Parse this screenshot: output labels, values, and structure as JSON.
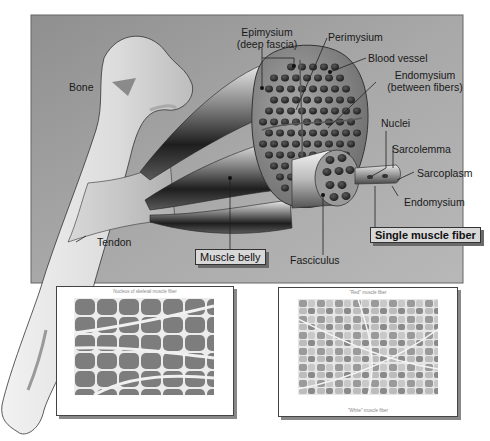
{
  "figure": {
    "colors": {
      "panel_bg": "#9e9e9e",
      "bone": "#e4e4e4",
      "muscle_dark": "#2e2e2e",
      "fascicle": "#8a8a8a",
      "label_box": "#d8d8d8"
    }
  },
  "labels": {
    "bone": "Bone",
    "tendon": "Tendon",
    "epimysium_line1": "Epimysium",
    "epimysium_line2": "(deep fascia)",
    "perimysium": "Perimysium",
    "blood_vessel": "Blood vessel",
    "endomysium_between_line1": "Endomysium",
    "endomysium_between_line2": "(between fibers)",
    "nuclei": "Nuclei",
    "sarcolemma": "Sarcolemma",
    "sarcoplasm": "Sarcoplasm",
    "endomysium": "Endomysium",
    "single_muscle_fiber": "Single muscle fiber",
    "muscle_belly": "Muscle belly",
    "fasciculus": "Fasciculus"
  },
  "micrographs": [
    {
      "caption_top": "Nucleus of skeletal muscle fiber",
      "caption_bottom": ""
    },
    {
      "caption_top": "\"Red\" muscle fiber",
      "caption_bottom": "\"White\" muscle fiber"
    }
  ]
}
